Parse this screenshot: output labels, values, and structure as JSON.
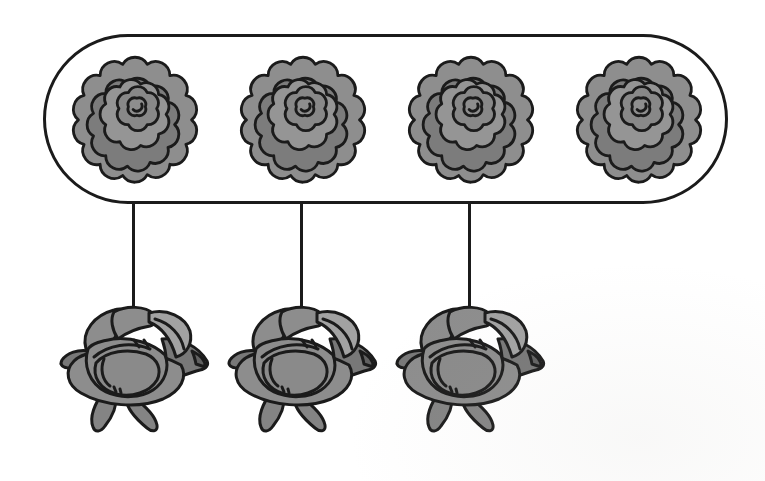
{
  "figure": {
    "type": "matching-groups-diagram",
    "group_box": {
      "shape": "stadium",
      "item": "marigold-flower",
      "count": 4
    },
    "connectors": {
      "count": 3
    },
    "bottom_row": {
      "item": "rose-flower",
      "count": 3
    },
    "colors": {
      "background": "#ffffff",
      "outline": "#1b1b1b",
      "marigold_fill": "#8e8e8e",
      "marigold_shade": "#7c7c7c",
      "marigold_mid": "#959595",
      "marigold_inner": "#888888",
      "rose_fill": "#8d8d8d",
      "rose_leaf": "#787878",
      "rose_leaf2": "#848484",
      "rose_light": "#a2a2a2",
      "rose_heart": "#8a8a8a",
      "rose_wedge": "#616161"
    }
  }
}
